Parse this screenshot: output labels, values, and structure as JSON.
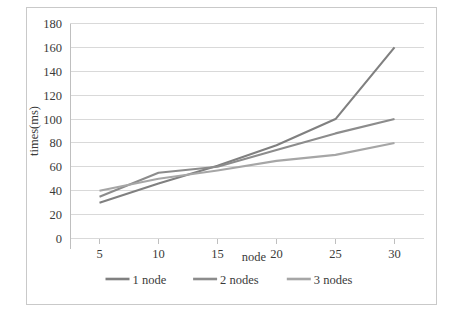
{
  "chart_data": {
    "type": "line",
    "title": "",
    "xlabel": "node",
    "ylabel": "times(ms)",
    "x": [
      5,
      10,
      15,
      20,
      25,
      30
    ],
    "xticklabels": [
      "5",
      "10",
      "15",
      "20",
      "25",
      "30"
    ],
    "xlim": [
      2.5,
      32.5
    ],
    "ylim": [
      0,
      180
    ],
    "yticks": [
      0,
      20,
      40,
      60,
      80,
      100,
      120,
      140,
      160,
      180
    ],
    "yticklabels": [
      "0",
      "20",
      "40",
      "60",
      "80",
      "100",
      "120",
      "140",
      "160",
      "180"
    ],
    "grid": "horizontal",
    "legend_position": "bottom",
    "series": [
      {
        "name": "1 node",
        "color": "#808080",
        "values": [
          30,
          46,
          61,
          78,
          100,
          160
        ]
      },
      {
        "name": "2 nodes",
        "color": "#8c8c8c",
        "values": [
          35,
          55,
          60,
          74,
          88,
          100
        ]
      },
      {
        "name": "3 nodes",
        "color": "#a6a6a6",
        "values": [
          40,
          50,
          57,
          65,
          70,
          80
        ]
      }
    ]
  },
  "axes": {
    "y_title": "times(ms)",
    "x_title": "node"
  },
  "legend": {
    "items": [
      {
        "label": "1 node",
        "color": "#808080"
      },
      {
        "label": "2 nodes",
        "color": "#8c8c8c"
      },
      {
        "label": "3 nodes",
        "color": "#a6a6a6"
      }
    ]
  },
  "colors": {
    "gridline": "#d9d9d9",
    "axis": "#bfbfbf",
    "frame": "#c9c9c9",
    "text": "#3a3a3a",
    "background": "#ffffff"
  }
}
